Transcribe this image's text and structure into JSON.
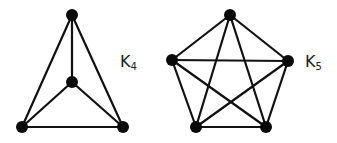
{
  "graphs": [
    {
      "id": "k4",
      "label": "K",
      "subscript": "4",
      "nodes": [
        {
          "x": 72,
          "y": 15
        },
        {
          "x": 72,
          "y": 82
        },
        {
          "x": 22,
          "y": 127
        },
        {
          "x": 123,
          "y": 127
        }
      ],
      "edges": [
        [
          0,
          1
        ],
        [
          0,
          2
        ],
        [
          0,
          3
        ],
        [
          1,
          2
        ],
        [
          1,
          3
        ],
        [
          2,
          3
        ]
      ]
    },
    {
      "id": "k5",
      "label": "K",
      "subscript": "5",
      "nodes": [
        {
          "x": 230,
          "y": 15
        },
        {
          "x": 172,
          "y": 60
        },
        {
          "x": 288,
          "y": 61
        },
        {
          "x": 196,
          "y": 127
        },
        {
          "x": 266,
          "y": 127
        }
      ],
      "edges": [
        [
          0,
          1
        ],
        [
          0,
          2
        ],
        [
          0,
          3
        ],
        [
          0,
          4
        ],
        [
          1,
          2
        ],
        [
          1,
          3
        ],
        [
          1,
          4
        ],
        [
          2,
          3
        ],
        [
          2,
          4
        ],
        [
          3,
          4
        ]
      ]
    }
  ],
  "colors": {
    "edge": "#111111",
    "node": "#0a0a0a",
    "text": "#222222"
  }
}
